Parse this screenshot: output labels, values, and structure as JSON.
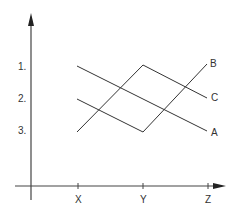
{
  "axes": {
    "x_ticks": [
      {
        "label": "X",
        "x": 78
      },
      {
        "label": "Y",
        "x": 143
      },
      {
        "label": "Z",
        "x": 208
      }
    ],
    "y_ticks": [
      {
        "label": "1.",
        "y": 66
      },
      {
        "label": "2.",
        "y": 99
      },
      {
        "label": "3.",
        "y": 132
      }
    ]
  },
  "lines": [
    {
      "label": "A",
      "points": [
        [
          77,
          66
        ],
        [
          207,
          131
        ]
      ]
    },
    {
      "label": "B",
      "points": [
        [
          77,
          99
        ],
        [
          143,
          132
        ],
        [
          207,
          64
        ]
      ]
    },
    {
      "label": "C",
      "points": [
        [
          77,
          132
        ],
        [
          143,
          65
        ],
        [
          207,
          98
        ]
      ]
    }
  ],
  "colors": {
    "stroke": "#333333"
  }
}
